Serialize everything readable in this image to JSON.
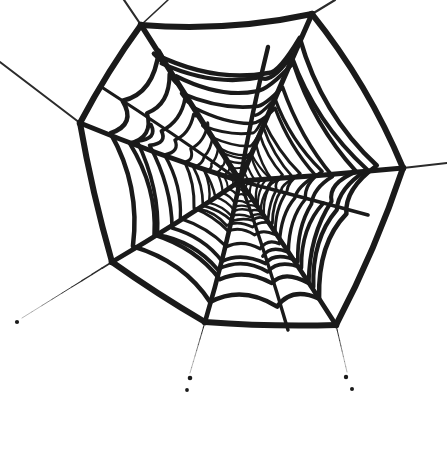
{
  "artwork": {
    "title": "Spider Web",
    "description": "Hand-drawn black ink spider web on white background",
    "canvas": {
      "width": 447,
      "height": 451
    },
    "background_color": "#ffffff",
    "ink_color": "#1a1a1a",
    "guy_line_color": "#2b2b2b",
    "hub": {
      "x": 240,
      "y": 181
    },
    "stroke_widths": {
      "frame": 6.0,
      "radial_outer": 5.0,
      "radial_inner": 3.2,
      "spiral_outer": 4.6,
      "spiral_mid": 3.4,
      "spiral_inner": 2.4,
      "guy_line": 2.0,
      "guy_line_thin": 1.1
    },
    "frame_anchors": [
      {
        "name": "top-left",
        "x": 141,
        "y": 25
      },
      {
        "name": "top-right",
        "x": 312,
        "y": 14
      },
      {
        "name": "upper-right",
        "x": 403,
        "y": 168
      },
      {
        "name": "lower-right",
        "x": 336,
        "y": 325
      },
      {
        "name": "bottom",
        "x": 205,
        "y": 322
      },
      {
        "name": "lower-left",
        "x": 112,
        "y": 262
      },
      {
        "name": "left",
        "x": 80,
        "y": 123
      }
    ],
    "frame_edges": [
      {
        "from": "top-left",
        "to": "top-right",
        "sag_x": 228,
        "sag_y": 32
      },
      {
        "from": "top-right",
        "to": "upper-right",
        "sag_x": 368,
        "sag_y": 84
      },
      {
        "from": "upper-right",
        "to": "lower-right",
        "sag_x": 376,
        "sag_y": 249
      },
      {
        "from": "lower-right",
        "to": "bottom",
        "sag_x": 271,
        "sag_y": 327
      },
      {
        "from": "bottom",
        "to": "lower-left",
        "sag_x": 157,
        "sag_y": 294
      },
      {
        "from": "lower-left",
        "to": "left",
        "sag_x": 92,
        "sag_y": 192
      },
      {
        "from": "left",
        "to": "top-left",
        "sag_x": 108,
        "sag_y": 70
      }
    ],
    "guy_lines": [
      {
        "name": "upper-left-bridge",
        "from": "left",
        "x2": 0,
        "y2": 62,
        "width": 2.0,
        "taper": false
      },
      {
        "name": "top-left-tether",
        "from": "top-left",
        "x2": 124,
        "y2": 0,
        "width": 2.2,
        "taper": false
      },
      {
        "name": "top-mid-tether",
        "from": "top-left",
        "x2": 168,
        "y2": 0,
        "width": 1.6,
        "taper": false
      },
      {
        "name": "top-right-tether",
        "from": "top-right",
        "x2": 335,
        "y2": 0,
        "width": 2.2,
        "taper": false
      },
      {
        "name": "right-tether",
        "from": "upper-right",
        "x2": 447,
        "y2": 163,
        "width": 2.0,
        "taper": false
      },
      {
        "name": "lower-left-tether",
        "from": "lower-left",
        "x2": 22,
        "y2": 318,
        "width": 1.9,
        "taper": true
      },
      {
        "name": "bottom-tether",
        "from": "bottom",
        "x2": 190,
        "y2": 373,
        "width": 1.2,
        "taper": true
      },
      {
        "name": "lower-right-tether",
        "from": "lower-right",
        "x2": 347,
        "y2": 372,
        "width": 1.2,
        "taper": true
      }
    ],
    "ink_dots": [
      {
        "name": "dot-lower-left",
        "x": 17,
        "y": 322,
        "r": 2.1
      },
      {
        "name": "dot-bottom-a",
        "x": 190,
        "y": 378,
        "r": 2.3
      },
      {
        "name": "dot-bottom-b",
        "x": 187,
        "y": 390,
        "r": 1.9
      },
      {
        "name": "dot-bottom-right-a",
        "x": 346,
        "y": 377,
        "r": 2.2
      },
      {
        "name": "dot-bottom-right-b",
        "x": 352,
        "y": 389,
        "r": 2.0
      }
    ],
    "radials": [
      {
        "name": "radial-top-left",
        "angle_deg": 212,
        "tip_x": 141,
        "tip_y": 25,
        "width": 5.4
      },
      {
        "name": "radial-top",
        "angle_deg": 250,
        "tip_x": 268,
        "tip_y": 47,
        "width": 4.4
      },
      {
        "name": "radial-top-right",
        "angle_deg": 295,
        "tip_x": 312,
        "tip_y": 14,
        "width": 5.2
      },
      {
        "name": "radial-right-upper",
        "angle_deg": 335,
        "tip_x": 403,
        "tip_y": 168,
        "width": 5.0
      },
      {
        "name": "radial-right",
        "angle_deg": 5,
        "tip_x": 368,
        "tip_y": 215,
        "width": 3.6
      },
      {
        "name": "radial-lower-right",
        "angle_deg": 34,
        "tip_x": 336,
        "tip_y": 325,
        "width": 4.8
      },
      {
        "name": "radial-bottom-right",
        "angle_deg": 62,
        "tip_x": 288,
        "tip_y": 330,
        "width": 3.4
      },
      {
        "name": "radial-bottom",
        "angle_deg": 91,
        "tip_x": 205,
        "tip_y": 322,
        "width": 4.6
      },
      {
        "name": "radial-bottom-left",
        "angle_deg": 126,
        "tip_x": 112,
        "tip_y": 262,
        "width": 4.8
      },
      {
        "name": "radial-left",
        "angle_deg": 168,
        "tip_x": 80,
        "tip_y": 123,
        "width": 5.0
      },
      {
        "name": "radial-left-upper",
        "angle_deg": 190,
        "tip_x": 103,
        "tip_y": 88,
        "width": 3.2
      }
    ],
    "rings": [
      {
        "name": "ring-1",
        "scale": 0.055,
        "width": 1.9,
        "jitter": 1.0
      },
      {
        "name": "ring-2",
        "scale": 0.095,
        "width": 2.1,
        "jitter": 1.5
      },
      {
        "name": "ring-3",
        "scale": 0.145,
        "width": 2.3,
        "jitter": 2.0
      },
      {
        "name": "ring-4",
        "scale": 0.205,
        "width": 2.5,
        "jitter": 2.5
      },
      {
        "name": "ring-5",
        "scale": 0.275,
        "width": 2.7,
        "jitter": 3.0
      },
      {
        "name": "ring-6",
        "scale": 0.355,
        "width": 3.0,
        "jitter": 3.4
      },
      {
        "name": "ring-7",
        "scale": 0.45,
        "width": 3.3,
        "jitter": 3.8
      },
      {
        "name": "ring-8",
        "scale": 0.56,
        "width": 3.7,
        "jitter": 4.2
      },
      {
        "name": "ring-9",
        "scale": 0.69,
        "width": 4.1,
        "jitter": 4.6
      },
      {
        "name": "ring-10",
        "scale": 0.84,
        "width": 4.5,
        "jitter": 5.0
      }
    ],
    "partial_rings": [
      {
        "name": "partial-ring-a",
        "scale": 0.175,
        "from": 0,
        "to": 7,
        "width": 2.2,
        "jitter": 2.0
      },
      {
        "name": "partial-ring-b",
        "scale": 0.24,
        "from": 3,
        "to": 9,
        "width": 2.4,
        "jitter": 2.4
      },
      {
        "name": "partial-ring-c",
        "scale": 0.315,
        "from": 2,
        "to": 8,
        "width": 2.8,
        "jitter": 3.0
      },
      {
        "name": "partial-ring-d",
        "scale": 0.505,
        "from": 1,
        "to": 6,
        "width": 3.4,
        "jitter": 3.6
      },
      {
        "name": "partial-ring-e",
        "scale": 0.625,
        "from": 4,
        "to": 10,
        "width": 3.8,
        "jitter": 4.0
      },
      {
        "name": "partial-ring-f",
        "scale": 0.76,
        "from": 0,
        "to": 5,
        "width": 4.2,
        "jitter": 4.4
      }
    ]
  }
}
